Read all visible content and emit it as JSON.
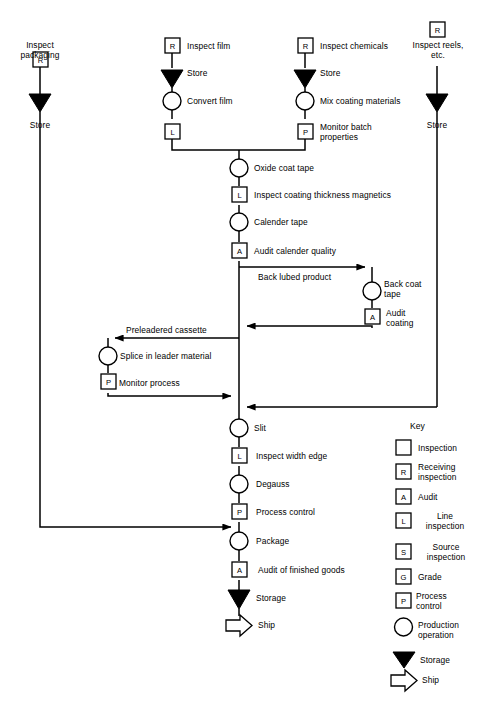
{
  "diagram": {
    "type": "process-flow",
    "line_color": "#000000",
    "background": "#ffffff"
  },
  "branches": {
    "packaging": {
      "name": "Inspect packaging branch",
      "nodes": [
        {
          "symbol": "R",
          "shape": "square",
          "label": "Inspect\npackaging",
          "label_pos": "below-center"
        },
        {
          "symbol": "storage",
          "shape": "triangle",
          "label": "Store",
          "label_pos": "below-center"
        }
      ]
    },
    "film": {
      "name": "Inspect film branch",
      "nodes": [
        {
          "symbol": "R",
          "shape": "square",
          "label": "Inspect film"
        },
        {
          "symbol": "storage",
          "shape": "triangle",
          "label": "Store"
        },
        {
          "symbol": "operation",
          "shape": "circle",
          "label": "Convert film"
        },
        {
          "symbol": "L",
          "shape": "square",
          "label": ""
        }
      ]
    },
    "chemicals": {
      "name": "Inspect chemicals branch",
      "nodes": [
        {
          "symbol": "R",
          "shape": "square",
          "label": "Inspect chemicals"
        },
        {
          "symbol": "storage",
          "shape": "triangle",
          "label": "Store"
        },
        {
          "symbol": "operation",
          "shape": "circle",
          "label": "Mix coating materials"
        },
        {
          "symbol": "P",
          "shape": "square",
          "label": "Monitor batch\nproperties"
        }
      ]
    },
    "reels": {
      "name": "Inspect reels branch",
      "nodes": [
        {
          "symbol": "R",
          "shape": "square",
          "label": "Inspect reels,\netc.",
          "label_pos": "below-center"
        },
        {
          "symbol": "storage",
          "shape": "triangle",
          "label": "Store",
          "label_pos": "below-center"
        }
      ]
    }
  },
  "main_line": {
    "name": "Main production line",
    "nodes": [
      {
        "symbol": "operation",
        "shape": "circle",
        "label": "Oxide coat tape"
      },
      {
        "symbol": "L",
        "shape": "square",
        "label": "Inspect coating thickness magnetics"
      },
      {
        "symbol": "operation",
        "shape": "circle",
        "label": "Calender tape"
      },
      {
        "symbol": "A",
        "shape": "square",
        "label": "Audit calender quality"
      },
      {
        "symbol": "operation",
        "shape": "circle",
        "label": "Slit"
      },
      {
        "symbol": "L",
        "shape": "square",
        "label": "Inspect width edge"
      },
      {
        "symbol": "operation",
        "shape": "circle",
        "label": "Degauss"
      },
      {
        "symbol": "P",
        "shape": "square",
        "label": "Process control"
      },
      {
        "symbol": "operation",
        "shape": "circle",
        "label": "Package"
      },
      {
        "symbol": "A",
        "shape": "square",
        "label": "Audit of finished goods"
      },
      {
        "symbol": "storage",
        "shape": "triangle",
        "label": "Storage"
      },
      {
        "symbol": "ship",
        "shape": "arrow",
        "label": "Ship"
      }
    ]
  },
  "loops": {
    "back_coat": {
      "name": "Back coat loop",
      "outbound_label": "Back lubed product",
      "nodes": [
        {
          "symbol": "operation",
          "shape": "circle",
          "label": "Back coat\ntape"
        },
        {
          "symbol": "A",
          "shape": "square",
          "label": "Audit\ncoating"
        }
      ]
    },
    "splice": {
      "name": "Splice loop",
      "inbound_label": "Preleadered cassette",
      "nodes": [
        {
          "symbol": "operation",
          "shape": "circle",
          "label": "Splice in leader material"
        },
        {
          "symbol": "P",
          "shape": "square",
          "label": "Monitor process"
        }
      ]
    }
  },
  "key": {
    "title": "Key",
    "items": [
      {
        "symbol": "",
        "shape": "square",
        "label": "Inspection"
      },
      {
        "symbol": "R",
        "shape": "square",
        "label": "Receiving\ninspection"
      },
      {
        "symbol": "A",
        "shape": "square",
        "label": "Audit"
      },
      {
        "symbol": "L",
        "shape": "square",
        "label": "Line\ninspection"
      },
      {
        "symbol": "S",
        "shape": "square",
        "label": "Source\ninspection"
      },
      {
        "symbol": "G",
        "shape": "square",
        "label": "Grade"
      },
      {
        "symbol": "P",
        "shape": "square",
        "label": "Process\ncontrol"
      },
      {
        "symbol": "",
        "shape": "circle",
        "label": "Production\noperation"
      },
      {
        "symbol": "",
        "shape": "triangle",
        "label": "Storage"
      },
      {
        "symbol": "",
        "shape": "arrow",
        "label": "Ship"
      }
    ]
  }
}
